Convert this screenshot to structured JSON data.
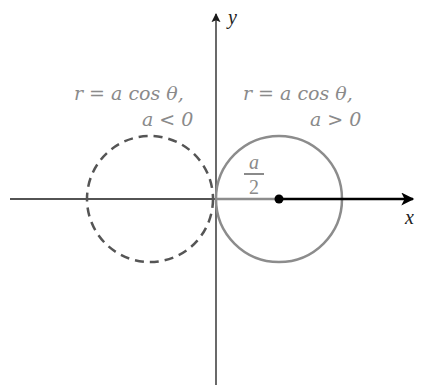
{
  "diagram": {
    "axes": {
      "x_label": "x",
      "y_label": "y",
      "origin_px": [
        216,
        199
      ]
    },
    "curves": [
      {
        "id": "circle-a-negative",
        "style": "dashed",
        "color": "#555555",
        "center_px": [
          150,
          199
        ],
        "radius_px": 63,
        "label_line1": "r = a cos θ,",
        "label_line2": "a < 0"
      },
      {
        "id": "circle-a-positive",
        "style": "solid",
        "color": "#8c8c8c",
        "center_px": [
          279,
          199
        ],
        "radius_px": 63,
        "label_line1": "r = a cos θ,",
        "label_line2": "a > 0"
      }
    ],
    "radius_annotation": {
      "numerator": "a",
      "denominator": "2"
    },
    "colors": {
      "axis": "#1a1a1a",
      "label_gray": "#8a8a8a",
      "dashed_circle": "#555555",
      "solid_circle": "#8c8c8c",
      "ray": "#000000"
    }
  }
}
